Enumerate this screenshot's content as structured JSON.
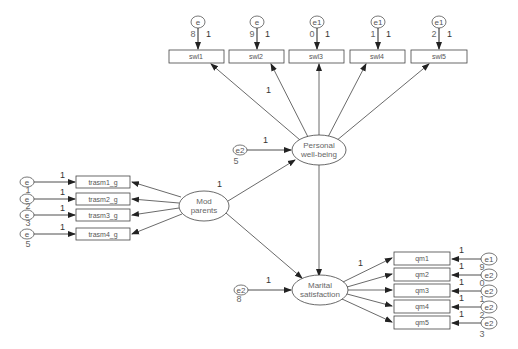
{
  "diagram": {
    "type": "structural-equation-model",
    "latents": [
      {
        "id": "pwb",
        "label_line1": "Personal",
        "label_line2": "well-being",
        "variance_label": ""
      },
      {
        "id": "mod",
        "label_line1": "Mod",
        "label_line2": "parents",
        "variance_label": "1"
      },
      {
        "id": "ms",
        "label_line1": "Marital",
        "label_line2": "satisfaction",
        "variance_label": ""
      }
    ],
    "observed_top": [
      {
        "label": "swl1",
        "error": "e",
        "error_sub": "8",
        "loading": "1"
      },
      {
        "label": "swl2",
        "error": "e",
        "error_sub": "9",
        "loading": "1"
      },
      {
        "label": "swl3",
        "error": "e1",
        "error_sub": "0",
        "loading": "1"
      },
      {
        "label": "swl4",
        "error": "e1",
        "error_sub": "1",
        "loading": "1"
      },
      {
        "label": "swl5",
        "error": "e1",
        "error_sub": "2",
        "loading": "1"
      }
    ],
    "observed_left": [
      {
        "label": "trasm1_g",
        "error": "e",
        "error_sub": "1",
        "loading": "1"
      },
      {
        "label": "trasm2_g",
        "error": "e",
        "error_sub": "2",
        "loading": "1"
      },
      {
        "label": "trasm3_g",
        "error": "e",
        "error_sub": "3",
        "loading": "1"
      },
      {
        "label": "trasm4_g",
        "error": "e",
        "error_sub": "5",
        "loading": "1"
      }
    ],
    "observed_right": [
      {
        "label": "qm1",
        "error": "e1",
        "error_sub": "",
        "loading": "1"
      },
      {
        "label": "qm2",
        "error": "e2",
        "error_sub": "9",
        "loading": "1"
      },
      {
        "label": "qm3",
        "error": "e2",
        "error_sub": "0",
        "loading": "1"
      },
      {
        "label": "qm4",
        "error": "e2",
        "error_sub": "1",
        "loading": "1"
      },
      {
        "label": "qm5",
        "error": "e2",
        "error_sub": "2",
        "loading": "1"
      }
    ],
    "residuals": [
      {
        "target": "pwb",
        "label": "e2",
        "sub": "5",
        "loading": "1"
      },
      {
        "target": "ms",
        "label": "e2",
        "sub": "8",
        "loading": "1"
      }
    ],
    "loading_pwb_swl1": "1",
    "loading_ms_qm1": "1",
    "extra_sub_qm5": "3",
    "extra_sub_left": "4"
  }
}
